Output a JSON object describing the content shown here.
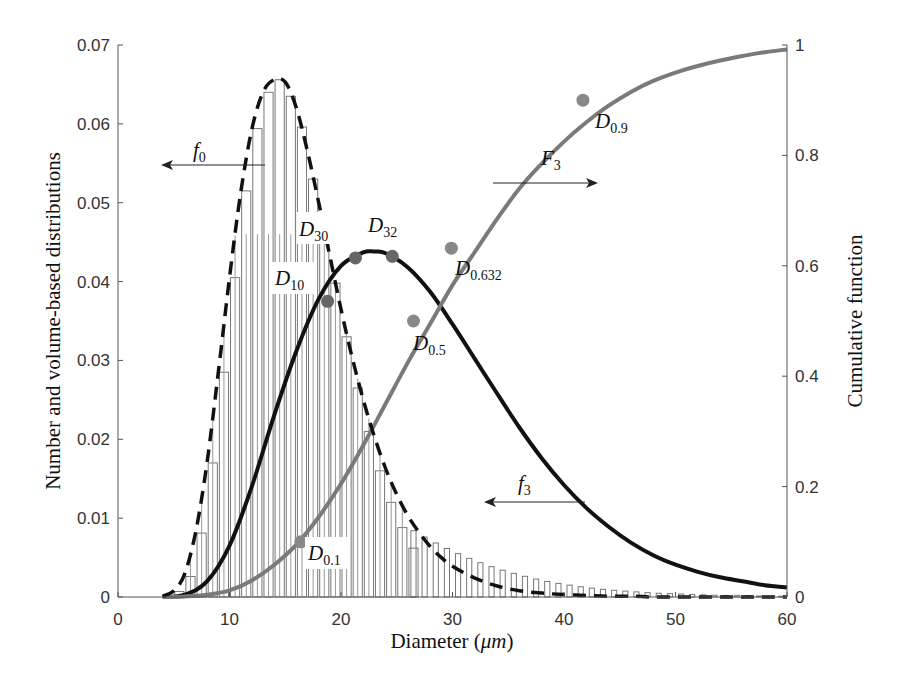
{
  "chart_data": {
    "type": "bar+line",
    "title": "",
    "xlabel": "Diameter (μm)",
    "ylabel": "Number and volume-based distributions",
    "y2label": "Cumulative function",
    "xlim": [
      0,
      60
    ],
    "ylim": [
      0,
      0.07
    ],
    "y2lim": [
      0,
      1
    ],
    "xticks": [
      "0",
      "10",
      "20",
      "30",
      "40",
      "50",
      "60"
    ],
    "yticks": [
      "0",
      "0.01",
      "0.02",
      "0.03",
      "0.04",
      "0.05",
      "0.06",
      "0.07"
    ],
    "y2ticks": [
      "0",
      "0.2",
      "0.4",
      "0.6",
      "0.8",
      "1"
    ],
    "grid": false,
    "legend": "none (inline arrow annotations)",
    "series": [
      {
        "name": "f0 histogram (number-based)",
        "type": "bar",
        "axis": "left",
        "bin_centers": [
          5.5,
          6.5,
          7.5,
          8.5,
          9.5,
          10.5,
          11.5,
          12.5,
          13.5,
          14.5,
          15.5,
          16.5,
          17.5,
          18.5,
          19.5,
          20.5,
          21.5,
          22.5,
          23.5,
          24.5,
          25.5,
          26.5
        ],
        "values": [
          0.0007,
          0.0026,
          0.0081,
          0.017,
          0.0285,
          0.0405,
          0.0515,
          0.0594,
          0.064,
          0.0656,
          0.0635,
          0.0596,
          0.053,
          0.047,
          0.0398,
          0.033,
          0.0265,
          0.021,
          0.016,
          0.012,
          0.0088,
          0.0062
        ]
      },
      {
        "name": "f3 histogram (volume-based)",
        "type": "bar",
        "axis": "left",
        "bin_centers": [
          5.5,
          8.5,
          11.5,
          14.5,
          17.5,
          20.5,
          23.5,
          26.5,
          29.5,
          32.5,
          35.5,
          38.5,
          41.5,
          44.5,
          47.5,
          50.5,
          53.5,
          56.5,
          59.5
        ],
        "values": [
          0.0001,
          0.001,
          0.006,
          0.016,
          0.029,
          0.0395,
          0.044,
          0.042,
          0.036,
          0.029,
          0.022,
          0.016,
          0.011,
          0.0074,
          0.0048,
          0.0031,
          0.002,
          0.0013,
          0.0008
        ]
      },
      {
        "name": "f0",
        "type": "line",
        "style": "dashed",
        "color": "#111111",
        "axis": "left",
        "x": [
          4,
          5,
          6,
          7,
          8,
          9,
          10,
          11,
          12,
          13,
          14,
          15,
          16,
          17,
          18,
          19,
          20,
          21,
          22,
          23,
          24,
          25,
          26,
          27,
          28,
          29,
          30,
          32,
          34,
          36,
          38,
          40,
          42,
          44,
          46,
          48,
          50,
          52,
          54,
          56,
          58,
          60
        ],
        "y": [
          0.0001,
          0.0008,
          0.003,
          0.0085,
          0.0172,
          0.0285,
          0.0405,
          0.0512,
          0.0593,
          0.064,
          0.0656,
          0.0653,
          0.062,
          0.0565,
          0.05,
          0.0432,
          0.0365,
          0.0304,
          0.025,
          0.0203,
          0.0163,
          0.013,
          0.0103,
          0.0082,
          0.0064,
          0.005,
          0.0039,
          0.0024,
          0.0014,
          0.0008,
          0.0005,
          0.0003,
          0.0002,
          0.0001,
          0.0001,
          0.0,
          0.0,
          0.0,
          0.0,
          0.0,
          0.0,
          0.0
        ]
      },
      {
        "name": "f3",
        "type": "line",
        "style": "solid",
        "color": "#111111",
        "axis": "left",
        "x": [
          4,
          6,
          8,
          10,
          12,
          14,
          16,
          18,
          20,
          22,
          23,
          24,
          26,
          28,
          30,
          32,
          34,
          36,
          38,
          40,
          42,
          44,
          46,
          48,
          50,
          52,
          54,
          56,
          58,
          60
        ],
        "y": [
          0.0,
          0.0003,
          0.002,
          0.0065,
          0.014,
          0.023,
          0.0312,
          0.0378,
          0.042,
          0.0437,
          0.0438,
          0.0436,
          0.0418,
          0.0387,
          0.0346,
          0.0302,
          0.0258,
          0.0215,
          0.0176,
          0.0142,
          0.0113,
          0.0089,
          0.0069,
          0.0053,
          0.0041,
          0.0032,
          0.0025,
          0.002,
          0.0015,
          0.0012
        ]
      },
      {
        "name": "F3",
        "type": "line",
        "style": "solid",
        "color": "#777777",
        "axis": "right",
        "x": [
          4,
          6,
          8,
          10,
          12,
          14,
          16,
          18,
          20,
          22,
          24,
          26,
          28,
          30,
          32,
          34,
          36,
          38,
          40,
          42,
          44,
          46,
          48,
          50,
          52,
          54,
          56,
          58,
          60
        ],
        "y": [
          0.0,
          0.001,
          0.004,
          0.012,
          0.03,
          0.058,
          0.095,
          0.145,
          0.205,
          0.275,
          0.35,
          0.425,
          0.495,
          0.565,
          0.625,
          0.685,
          0.74,
          0.785,
          0.825,
          0.86,
          0.89,
          0.915,
          0.935,
          0.95,
          0.962,
          0.972,
          0.98,
          0.987,
          0.992
        ]
      }
    ],
    "markers": [
      {
        "label": "D10",
        "x": 18.8,
        "y_left": 0.0375,
        "series": "f3",
        "color": "#666666"
      },
      {
        "label": "D30",
        "x": 21.3,
        "y_left": 0.043,
        "series": "f3",
        "color": "#666666"
      },
      {
        "label": "D32",
        "x": 24.6,
        "y_left": 0.0432,
        "series": "f3",
        "color": "#666666"
      },
      {
        "label": "D0.1",
        "x": 16.4,
        "y_right": 0.1,
        "series": "F3",
        "color": "#888888"
      },
      {
        "label": "D0.5",
        "x": 26.5,
        "y_right": 0.5,
        "series": "F3",
        "color": "#888888"
      },
      {
        "label": "D0.632",
        "x": 29.9,
        "y_right": 0.632,
        "series": "F3",
        "color": "#888888"
      },
      {
        "label": "D0.9",
        "x": 41.7,
        "y_right": 0.9,
        "series": "F3",
        "color": "#888888"
      }
    ],
    "annotations": [
      {
        "text": "f0",
        "arrow": "left",
        "points_to": "left axis"
      },
      {
        "text": "f3",
        "arrow": "left",
        "points_to": "left axis"
      },
      {
        "text": "F3",
        "arrow": "right",
        "points_to": "right axis"
      }
    ]
  },
  "labels": {
    "xlabel_text": "Diameter (",
    "xlabel_mu": "μm",
    "xlabel_close": ")",
    "ylabel": "Number and volume-based distributions",
    "y2label": "Cumulative function",
    "f0_main": "f",
    "f0_sub": "0",
    "f3_main": "f",
    "f3_sub": "3",
    "F3_main": "F",
    "F3_sub": "3",
    "D_main": "D",
    "d10_sub": "10",
    "d30_sub": "30",
    "d32_sub": "32",
    "d01_sub": "0.1",
    "d05_sub": "0.5",
    "d0632_sub": "0.632",
    "d09_sub": "0.9"
  },
  "colors": {
    "axis": "#555555",
    "bar_stroke": "#777777",
    "f0_line": "#111111",
    "f3_line": "#111111",
    "F3_line": "#7a7a7a",
    "marker_f3": "#666666",
    "marker_F3": "#8c8c8c"
  }
}
